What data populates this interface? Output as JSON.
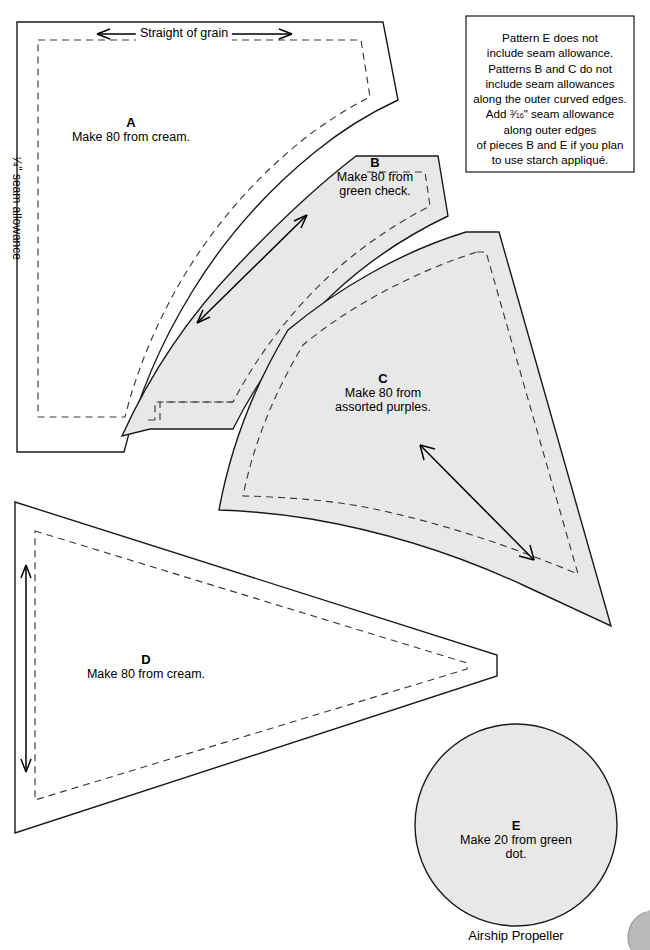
{
  "document": {
    "caption": "Airship Propeller",
    "background_color": "#ffffff",
    "shaded_fill": "#e8e8e8",
    "outline_color": "#1a1a1a",
    "seam_line_color": "#3a3a3a"
  },
  "grain": {
    "horizontal_label": "Straight of grain",
    "seam_allowance_label_prefix": "",
    "seam_allowance_fraction_numerator": "1",
    "seam_allowance_fraction_denominator": "4",
    "seam_allowance_label_suffix": "\" seam allowance"
  },
  "note": {
    "lines": [
      "Pattern E does not",
      "include seam allowance.",
      "Patterns B and C do not",
      "include seam allowances",
      "along the outer curved edges.",
      "along outer edges",
      "of pieces B and E if you plan",
      "to use starch appliqué."
    ],
    "add_line_prefix": "Add ",
    "add_fraction_numerator": "3",
    "add_fraction_denominator": "16",
    "add_line_suffix": "\" seam allowance"
  },
  "pieces": [
    {
      "id": "A",
      "letter": "A",
      "description": "Make 80 from cream.",
      "fill": "white",
      "quantity": 80,
      "fabric": "cream"
    },
    {
      "id": "B",
      "letter": "B",
      "description_line1": "Make 80 from",
      "description_line2": "green check.",
      "fill": "shaded",
      "quantity": 80,
      "fabric": "green check"
    },
    {
      "id": "C",
      "letter": "C",
      "description_line1": "Make 80 from",
      "description_line2": "assorted purples.",
      "fill": "shaded",
      "quantity": 80,
      "fabric": "assorted purples"
    },
    {
      "id": "D",
      "letter": "D",
      "description": "Make 80 from cream.",
      "fill": "white",
      "quantity": 80,
      "fabric": "cream"
    },
    {
      "id": "E",
      "letter": "E",
      "description": "Make 20 from green dot.",
      "fill": "shaded",
      "quantity": 20,
      "fabric": "green dot"
    }
  ]
}
